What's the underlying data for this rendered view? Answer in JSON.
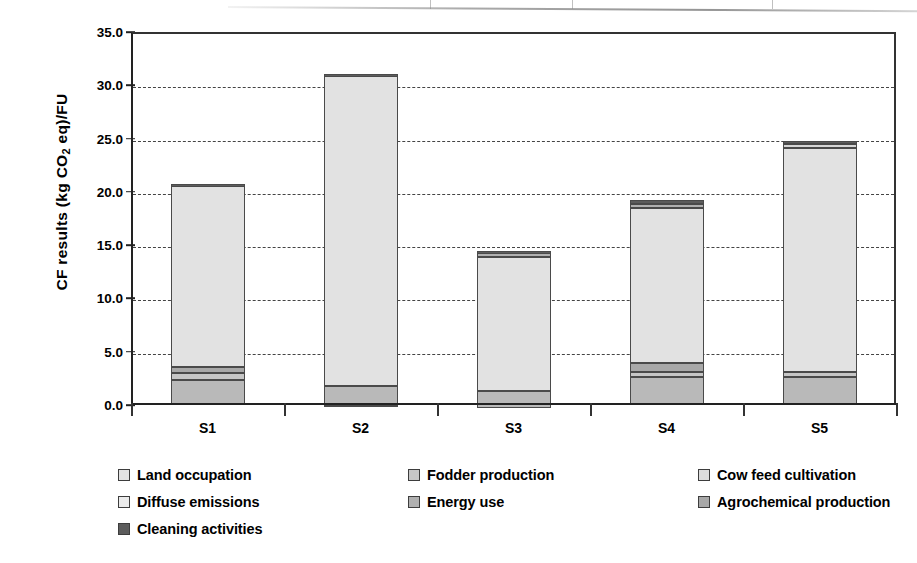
{
  "chart_data": {
    "type": "bar",
    "subtype": "stacked-bar",
    "title": "",
    "xlabel": "",
    "ylabel": "CF results (kg CO2 eq)/FU",
    "ylabel_parts": {
      "before": "CF results (kg CO",
      "sub": "2",
      "after": " eq)/FU"
    },
    "categories": [
      "S1",
      "S2",
      "S3",
      "S4",
      "S5"
    ],
    "ylim": [
      0.0,
      35.0
    ],
    "ytick_step": 5.0,
    "ytick_labels": [
      "0.0",
      "5.0",
      "10.0",
      "15.0",
      "20.0",
      "25.0",
      "30.0",
      "35.0"
    ],
    "ytick_values": [
      0.0,
      5.0,
      10.0,
      15.0,
      20.0,
      25.0,
      30.0,
      35.0
    ],
    "grid": "horizontal-dashed",
    "legend_position": "below",
    "series": [
      {
        "name": "Cow feed cultivation",
        "color": "#b9b9b9",
        "values": [
          2.3,
          1.85,
          1.65,
          2.6,
          2.6
        ]
      },
      {
        "name": "Fodder production",
        "color": "#c6c6c6",
        "values": [
          0.7,
          0.0,
          0.0,
          0.5,
          0.45
        ]
      },
      {
        "name": "Agrochemical production",
        "color": "#a8a8a8",
        "values": [
          0.6,
          0.0,
          0.0,
          0.8,
          0.0
        ]
      },
      {
        "name": "Land occupation",
        "color": "#e2e2e2",
        "values": [
          16.95,
          29.2,
          12.55,
          14.6,
          21.1
        ]
      },
      {
        "name": "Diffuse emissions",
        "color": "#d6d6d6",
        "values": [
          0.0,
          0.0,
          0.0,
          0.0,
          0.3
        ]
      },
      {
        "name": "Energy use",
        "color": "#b0b0b0",
        "values": [
          0.0,
          0.0,
          0.4,
          0.4,
          0.0
        ]
      },
      {
        "name": "Cleaning activities",
        "color": "#5c5c5c",
        "values": [
          0.15,
          0.1,
          0.15,
          0.35,
          0.3
        ]
      }
    ],
    "totals": [
      20.7,
      31.15,
      14.75,
      19.25,
      24.75
    ],
    "negative_offsets": [
      0.0,
      -0.1,
      -0.3,
      0.0,
      0.0
    ]
  },
  "legend": {
    "items": [
      {
        "label": "Land occupation",
        "color": "#e2e2e2"
      },
      {
        "label": "Fodder production",
        "color": "#c6c6c6"
      },
      {
        "label": "Cow feed cultivation",
        "color": "#dcdcdc"
      },
      {
        "label": "Diffuse emissions",
        "color": "#ebebeb"
      },
      {
        "label": "Energy use",
        "color": "#b0b0b0"
      },
      {
        "label": "Agrochemical production",
        "color": "#a8a8a8"
      },
      {
        "label": "Cleaning activities",
        "color": "#5c5c5c"
      }
    ]
  },
  "axis": {
    "x_labels": [
      "S1",
      "S2",
      "S3",
      "S4",
      "S5"
    ]
  }
}
